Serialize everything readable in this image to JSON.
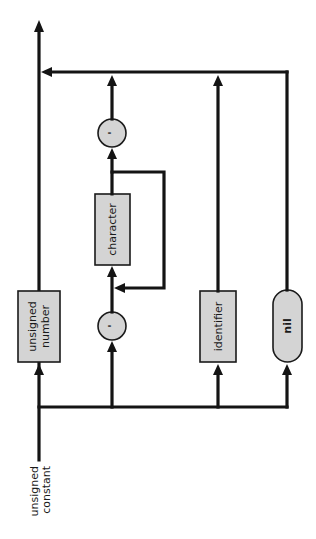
{
  "diagram": {
    "title": "unsigned constant",
    "type": "syntax-diagram",
    "orientation": "rotated-90-ccw",
    "colors": {
      "line": "#141414",
      "node_fill": "#d4d4d4",
      "node_stroke": "#1a1a1a",
      "background": "#ffffff"
    },
    "entry_label": {
      "line1": "unsigned",
      "line2": "constant"
    },
    "nodes": {
      "unsigned_number": {
        "kind": "nonterminal",
        "line1": "unsigned",
        "line2": "number"
      },
      "quote_open": {
        "kind": "terminal",
        "symbol": "'"
      },
      "character": {
        "kind": "nonterminal",
        "label": "character"
      },
      "quote_close": {
        "kind": "terminal",
        "symbol": "'"
      },
      "identifier": {
        "kind": "nonterminal",
        "label": "identifier"
      },
      "nil": {
        "kind": "reserved-word",
        "label": "nil"
      }
    },
    "paths": [
      [
        "unsigned_number"
      ],
      [
        "quote_open",
        "character (repeat)",
        "quote_close"
      ],
      [
        "identifier"
      ],
      [
        "nil"
      ]
    ]
  }
}
